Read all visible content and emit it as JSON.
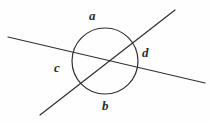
{
  "figure": {
    "type": "geometry-diagram",
    "background_color": "#fefefe",
    "stroke_color": "#303030",
    "label_color": "#2b2b2b",
    "width": 211,
    "height": 122,
    "circle": {
      "name": "circle",
      "center_x": 105,
      "center_y": 61,
      "radius": 33,
      "stroke_width": 1.2
    },
    "lines": [
      {
        "name": "shallow-line",
        "x1": 8,
        "y1": 37,
        "x2": 205,
        "y2": 83,
        "stroke_width": 1.2
      },
      {
        "name": "steep-line",
        "x1": 40,
        "y1": 115,
        "x2": 175,
        "y2": 10,
        "stroke_width": 1.2
      }
    ],
    "intersection": {
      "name": "lines-intersection",
      "x": 103,
      "y": 62
    },
    "labels": {
      "a": "a",
      "b": "b",
      "c": "c",
      "d": "d"
    },
    "label_positions": {
      "a": "top",
      "b": "bottom",
      "c": "left",
      "d": "right"
    }
  }
}
